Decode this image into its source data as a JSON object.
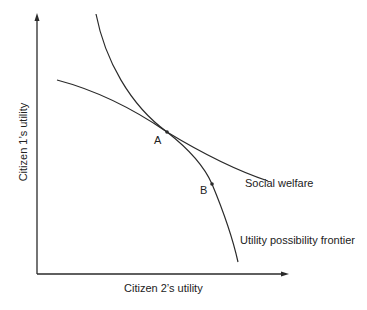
{
  "diagram": {
    "type": "economics-curve-diagram",
    "x_axis_label": "Citizen 2’s utility",
    "y_axis_label": "Citizen 1’s utility",
    "curves": [
      {
        "name": "Social welfare",
        "label": "Social welfare"
      },
      {
        "name": "Utility possibility frontier",
        "label": "Utility possibility frontier"
      }
    ],
    "points": [
      {
        "name": "A",
        "label": "A"
      },
      {
        "name": "B",
        "label": "B"
      }
    ],
    "colors": {
      "line": "#2a2a2a",
      "background": "#ffffff"
    }
  }
}
